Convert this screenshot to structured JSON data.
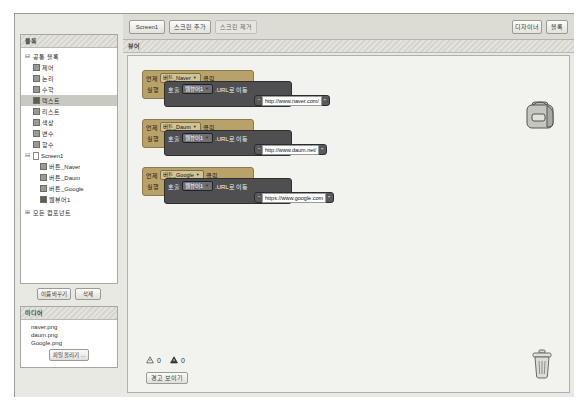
{
  "window": {
    "favorites_title": "Favorites"
  },
  "toolbar": {
    "screen_select": "Screen1",
    "add_screen": "스크린 추가",
    "remove_screen": "스크린 제거",
    "designer": "디자이너",
    "blocks": "블록"
  },
  "palette": {
    "title": "블록",
    "group_builtin": {
      "label": "공통 블록",
      "expander": "⊟",
      "items": [
        {
          "label": "제어",
          "selected": false
        },
        {
          "label": "논리",
          "selected": false
        },
        {
          "label": "수학",
          "selected": false
        },
        {
          "label": "텍스트",
          "selected": true
        },
        {
          "label": "리스트",
          "selected": false
        },
        {
          "label": "색상",
          "selected": false
        },
        {
          "label": "변수",
          "selected": false
        },
        {
          "label": "함수",
          "selected": false
        }
      ]
    },
    "group_screen": {
      "label": "Screen1",
      "expander": "⊟",
      "items": [
        {
          "label": "버튼_Naver"
        },
        {
          "label": "버튼_Daum"
        },
        {
          "label": "버튼_Google"
        },
        {
          "label": "웹뷰어1"
        }
      ]
    },
    "group_any": {
      "label": "모든 컴포넌트",
      "expander": "⊞"
    },
    "buttons": {
      "rename": "이름 바꾸기",
      "delete": "삭제"
    }
  },
  "media": {
    "title": "미디어",
    "files": [
      "naver.png",
      "daum.png",
      "Google.png"
    ],
    "upload_button": "파일 올리기 ..."
  },
  "viewer": {
    "title": "뷰어"
  },
  "blocks": [
    {
      "when_label": "언제",
      "component": "버튼_Naver",
      "event": "클릭",
      "do_label": "실행",
      "call_label": "호출",
      "target": "웹뷰어1",
      "method": ".URL로 이동",
      "socket_label": "url",
      "text_value": "http://www.naver.com/"
    },
    {
      "when_label": "언제",
      "component": "버튼_Daum",
      "event": "클릭",
      "do_label": "실행",
      "call_label": "호출",
      "target": "웹뷰어1",
      "method": ".URL로 이동",
      "socket_label": "url",
      "text_value": "http://www.daum.net/"
    },
    {
      "when_label": "언제",
      "component": "버튼_Google",
      "event": "클릭",
      "do_label": "실행",
      "call_label": "호출",
      "target": "웹뷰어1",
      "method": ".URL로 이동",
      "socket_label": "url",
      "text_value": "https://www.google.com"
    }
  ],
  "status": {
    "warning_count": "0",
    "error_count": "0",
    "show_warnings_button": "경고 보이기"
  },
  "icons": {
    "backpack": "backpack-icon",
    "trash": "trash-icon",
    "warning": "warning-triangle-icon",
    "error": "error-triangle-icon"
  },
  "colors": {
    "event_block": "#b9a26a",
    "call_block": "#4f4f52",
    "text_block": "#5a5a5d",
    "panel_bg": "#e9e9e4",
    "canvas_bg": "#f2f2ee"
  }
}
